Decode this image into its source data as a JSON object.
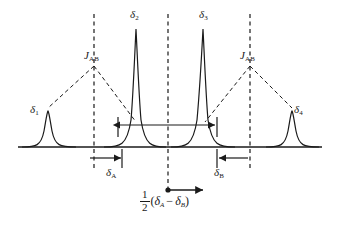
{
  "figure": {
    "background_color": "#ffffff",
    "line_color": "#1a1a1a",
    "width": 339,
    "height": 230
  },
  "peaks": [
    {
      "id": "peak-1",
      "label": "δ",
      "sub": "1",
      "x": 48,
      "height": 36,
      "width": 7,
      "label_x": 30,
      "label_y": 104
    },
    {
      "id": "peak-2",
      "label": "δ",
      "sub": "2",
      "x": 136,
      "height": 118,
      "width": 6,
      "label_x": 130,
      "label_y": 9
    },
    {
      "id": "peak-3",
      "label": "δ",
      "sub": "3",
      "x": 203,
      "height": 118,
      "width": 6,
      "label_x": 199,
      "label_y": 9
    },
    {
      "id": "peak-4",
      "label": "δ",
      "sub": "4",
      "x": 292,
      "height": 36,
      "width": 7,
      "label_x": 294,
      "label_y": 104
    }
  ],
  "coupling_labels": [
    {
      "id": "j-left",
      "symbol": "J",
      "sub": "AB",
      "x": 84,
      "y": 50
    },
    {
      "id": "j-right",
      "symbol": "J",
      "sub": "AB",
      "x": 240,
      "y": 50
    }
  ],
  "shift_labels": [
    {
      "id": "delta-a",
      "label": "δ",
      "sub": "A",
      "x": 106,
      "y": 167
    },
    {
      "id": "delta-b",
      "label": "δ",
      "sub": "B",
      "x": 214,
      "y": 167
    }
  ],
  "center_formula": {
    "numerator": "1",
    "denominator": "2",
    "expression_open": "(",
    "term_a": "δ",
    "term_a_sub": "A",
    "operator": "−",
    "term_b": "δ",
    "term_b_sub": "B",
    "expression_close": ")"
  },
  "dashed_lines": [
    {
      "id": "dash-left",
      "x": 94
    },
    {
      "id": "dash-center",
      "x": 168
    },
    {
      "id": "dash-right",
      "x": 250
    }
  ],
  "baseline": {
    "y": 147,
    "x_start": 18,
    "x_end": 322
  },
  "measure_arrows": [
    {
      "id": "inner-span-arrow",
      "x1": 118,
      "x2": 217,
      "y": 125,
      "double_headed": true
    },
    {
      "id": "delta-a-arrow",
      "x1": 88,
      "x2": 122,
      "y": 158,
      "double_headed": false
    },
    {
      "id": "delta-b-arrow",
      "x1": 249,
      "x2": 217,
      "y": 158,
      "double_headed": false
    },
    {
      "id": "center-offset-arrow",
      "x1": 168,
      "x2": 205,
      "y": 190,
      "double_headed": false
    }
  ]
}
